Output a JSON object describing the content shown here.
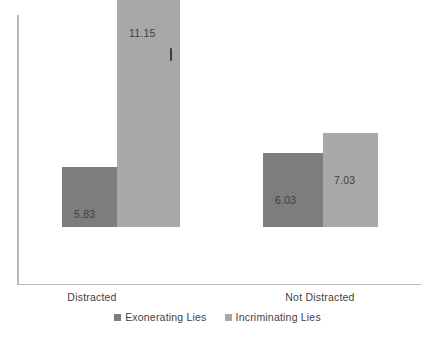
{
  "chart_data": {
    "type": "bar",
    "title": "",
    "subtitle": "",
    "xlabel": "",
    "ylabel": "",
    "categories": [
      "Distracted",
      "Not Distracted"
    ],
    "series": [
      {
        "name": "Exonerating Lies",
        "color": "#7d7d7d",
        "values": [
          5.83,
          6.03
        ]
      },
      {
        "name": "Incriminating Lies",
        "color": "#a8a8a8",
        "values": [
          11.15,
          7.03
        ]
      }
    ],
    "data_labels": [
      {
        "category": "Distracted",
        "series": "Exonerating Lies",
        "text": "5.83"
      },
      {
        "category": "Distracted",
        "series": "Incriminating Lies",
        "text": "11.15"
      },
      {
        "category": "Not Distracted",
        "series": "Exonerating Lies",
        "text": "6.03"
      },
      {
        "category": "Not Distracted",
        "series": "Incriminating Lies",
        "text": "7.03"
      }
    ],
    "grid": false,
    "legend_position": "bottom",
    "axis_color": "#b8b8b8",
    "tick_labels_y": [],
    "annotations": []
  },
  "legend": {
    "items": [
      {
        "label": "Exonerating Lies",
        "swatch": "dark"
      },
      {
        "label": "Incriminating Lies",
        "swatch": "light"
      }
    ]
  },
  "axis": {
    "category_labels": [
      "Distracted",
      "Not Distracted"
    ]
  }
}
